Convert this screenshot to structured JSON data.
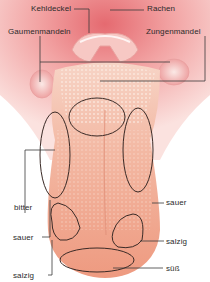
{
  "diagram": {
    "type": "anatomical-diagram",
    "colors": {
      "background": "#ffffff",
      "throat_pink": "#f3a5a5",
      "throat_deep": "#e7777a",
      "tongue": "#f1ad95",
      "tongue_tip": "#ee9f85",
      "papillae": "#f9e3d6",
      "outline": "#3a2a26",
      "leader_line": "#3a3a3a",
      "text": "#2b2b2b"
    },
    "labels": {
      "kehldeckel": "Kehldeckel",
      "rachen": "Rachen",
      "gaumenmandeln": "Gaumenmandeln",
      "zungenmandel": "Zungenmandel",
      "bitter": "bitter",
      "sauer_right": "sauer",
      "sauer_left": "sauer",
      "salzig_right": "salzig",
      "salzig_left": "salzig",
      "suess": "süß"
    },
    "zones": [
      {
        "name": "bitter",
        "region": "back center"
      },
      {
        "name": "sauer",
        "region": "left side"
      },
      {
        "name": "sauer",
        "region": "right side"
      },
      {
        "name": "salzig",
        "region": "front left"
      },
      {
        "name": "salzig",
        "region": "front right"
      },
      {
        "name": "süß",
        "region": "tip"
      }
    ]
  }
}
